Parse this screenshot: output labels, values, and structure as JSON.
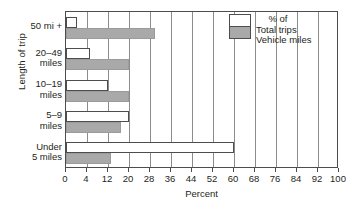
{
  "chart_data": {
    "type": "bar",
    "orientation": "horizontal",
    "title": "",
    "xlabel": "Percent",
    "ylabel": "Length of trip",
    "categories": [
      "Under\n5 miles",
      "5–9\nmiles",
      "10–19\nmiles",
      "20–49\nmiles",
      "50 mi +"
    ],
    "series": [
      {
        "name": "Total trips",
        "key": "total",
        "color": "#ffffff",
        "values": [
          60,
          20,
          12,
          5,
          2
        ]
      },
      {
        "name": "Vehicle miles",
        "key": "vehicle",
        "color": "#a9a9a9",
        "values": [
          13,
          17,
          20,
          20,
          30
        ]
      }
    ],
    "xlim": [
      0,
      100
    ],
    "xticks": [
      0,
      4,
      12,
      20,
      28,
      36,
      44,
      52,
      60,
      68,
      76,
      84,
      92,
      100
    ],
    "xticklabels": [
      "0",
      "4",
      "12",
      "20",
      "28",
      "36",
      "44",
      "52",
      "60",
      "68",
      "76",
      "84",
      "92",
      "100"
    ],
    "grid": true,
    "grid_axis": "x",
    "legend_position": "top-right",
    "legend_header": "% of"
  },
  "legend": {
    "header": "% of",
    "items": [
      {
        "label": "Total trips",
        "color": "#ffffff"
      },
      {
        "label": "Vehicle miles",
        "color": "#a9a9a9"
      }
    ]
  },
  "axes": {
    "x_title": "Percent",
    "y_title": "Length of trip"
  },
  "colors": {
    "vehicle_miles": "#a9a9a9",
    "total_trips": "#ffffff",
    "axis": "#4d4d4d",
    "grid": "#8c8c8c"
  }
}
